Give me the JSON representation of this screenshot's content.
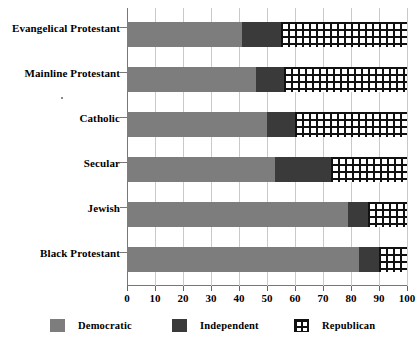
{
  "chart_data": {
    "type": "bar",
    "orientation": "horizontal",
    "stacked": true,
    "stacked_percent": true,
    "title": "",
    "subtitle": "",
    "xlabel": "",
    "ylabel": "",
    "xlim": [
      0,
      100
    ],
    "xticks": [
      0,
      10,
      20,
      30,
      40,
      50,
      60,
      70,
      80,
      90,
      100
    ],
    "xtick_labels": [
      "0",
      "10",
      "20",
      "30",
      "40",
      "50",
      "60",
      "70",
      "80",
      "90",
      "100"
    ],
    "grid": "vertical",
    "legend_position": "bottom",
    "categories": [
      "Evangelical Protestant",
      "Mainline Protestant",
      "Catholic",
      "Secular",
      "Jewish",
      "Black Protestant"
    ],
    "series": [
      {
        "name": "Democratic",
        "color": "#7d7d7d",
        "pattern": "solid",
        "values": [
          41,
          46,
          50,
          53,
          79,
          83
        ]
      },
      {
        "name": "Independent",
        "color": "#3a3a3a",
        "pattern": "solid",
        "values": [
          14,
          10,
          10,
          20,
          7,
          7
        ]
      },
      {
        "name": "Republican",
        "color": "#ffffff",
        "pattern": "crosshatch",
        "values": [
          45,
          44,
          40,
          27,
          14,
          10
        ]
      }
    ],
    "cumulative_boundaries": [
      [
        41,
        55
      ],
      [
        46,
        56
      ],
      [
        50,
        60
      ],
      [
        53,
        73
      ],
      [
        79,
        86
      ],
      [
        83,
        90
      ]
    ]
  },
  "legend": {
    "items": [
      {
        "label": "Democratic",
        "swatch": "democratic-swatch"
      },
      {
        "label": "Independent",
        "swatch": "independent-swatch"
      },
      {
        "label": "Republican",
        "swatch": "republican-swatch"
      }
    ]
  }
}
